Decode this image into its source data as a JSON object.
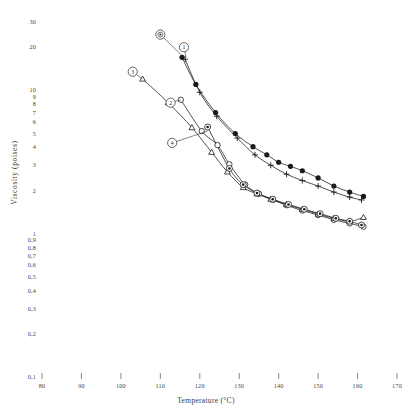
{
  "chart_data": {
    "type": "line",
    "title": "",
    "xlabel": "Temperature (°C)",
    "ylabel": "Viscosity (poises)",
    "xlim": [
      80,
      170
    ],
    "ylim": [
      0.1,
      30
    ],
    "yscale": "log",
    "xscale": "linear",
    "grid": false,
    "legend": "none",
    "xticks": [
      80,
      90,
      100,
      110,
      120,
      130,
      140,
      150,
      160,
      170
    ],
    "xtick_labels": [
      "80",
      "90",
      "100",
      "110",
      "120",
      "130",
      "140",
      "150",
      "160",
      "170"
    ],
    "yticks": [
      30,
      20,
      10,
      9,
      8,
      7,
      6,
      5,
      4,
      3,
      2,
      1,
      0.9,
      0.8,
      0.7,
      0.6,
      0.5,
      0.4,
      0.3,
      0.2,
      0.1
    ],
    "ytick_labels": [
      "30",
      "20",
      "10",
      "9",
      "8",
      "7",
      "6",
      "5",
      "4",
      "3",
      "2",
      "1",
      "0,9",
      "0,8",
      "0,7",
      "0,6",
      "0,5",
      "0,4",
      "0,3",
      "0,2",
      "0,1"
    ],
    "annotations": [
      {
        "text": "⓪",
        "label": "circled-marker",
        "x": 110.0,
        "y": 24.5,
        "anchor_x": 115.5,
        "anchor_y": 17.5
      },
      {
        "text": "①",
        "label": "1",
        "x": 116.0,
        "y": 20.0,
        "anchor_x": 116.5,
        "anchor_y": 17.0
      },
      {
        "text": "②",
        "label": "2",
        "x": 112.6,
        "y": 8.2,
        "anchor_x": 115.2,
        "anchor_y": 8.6
      },
      {
        "text": "③",
        "label": "3",
        "x": 103.0,
        "y": 13.5,
        "anchor_x": 105.5,
        "anchor_y": 12.0
      },
      {
        "text": "④",
        "label": "4",
        "x": 113.0,
        "y": 4.3,
        "anchor_x": 122.0,
        "anchor_y": 5.2
      }
    ],
    "series": [
      {
        "name": "Series 1 (filled circle)",
        "marker": "filled-circle",
        "color": "#1a1a1a",
        "x": [
          115.5,
          119.0,
          124.0,
          129.0,
          133.5,
          137.0,
          140.0,
          143.0,
          146.0,
          150.0,
          154.0,
          158.0,
          161.5
        ],
        "values": [
          17.0,
          11.0,
          7.0,
          5.0,
          4.05,
          3.55,
          3.15,
          2.95,
          2.75,
          2.45,
          2.15,
          1.95,
          1.82
        ]
      },
      {
        "name": "Series 2 (plus)",
        "marker": "plus",
        "color": "#1a1a1a",
        "x": [
          116.3,
          120.0,
          124.3,
          129.5,
          134.0,
          138.0,
          142.0,
          146.0,
          150.0,
          154.0,
          158.0,
          161.0
        ],
        "values": [
          16.5,
          9.7,
          6.6,
          4.65,
          3.55,
          3.0,
          2.6,
          2.35,
          2.15,
          1.95,
          1.8,
          1.72
        ]
      },
      {
        "name": "Series 3 (open circle)",
        "marker": "open-circle",
        "color": "#1a1a1a",
        "x": [
          115.2,
          120.5,
          124.5,
          127.5,
          131.5,
          135.0,
          138.5,
          142.0,
          146.0,
          150.0,
          154.0,
          158.0,
          161.5
        ],
        "values": [
          8.6,
          5.2,
          4.15,
          3.05,
          2.2,
          1.9,
          1.72,
          1.58,
          1.45,
          1.35,
          1.25,
          1.18,
          1.12
        ]
      },
      {
        "name": "Series 4 (triangle)",
        "marker": "triangle",
        "color": "#1a1a1a",
        "x": [
          105.5,
          112.0,
          118.0,
          123.0,
          127.0,
          131.0,
          134.5,
          138.0,
          142.0,
          146.0,
          150.0,
          154.0,
          158.0,
          161.5
        ],
        "values": [
          12.0,
          8.2,
          5.5,
          3.7,
          2.7,
          2.1,
          1.9,
          1.74,
          1.6,
          1.48,
          1.37,
          1.28,
          1.22,
          1.3
        ]
      },
      {
        "name": "Series 5 (circled dot)",
        "marker": "circled-dot",
        "color": "#1a1a1a",
        "x": [
          122.0,
          127.5,
          131.0,
          134.5,
          138.5,
          142.5,
          146.5,
          150.5,
          154.5,
          158.0,
          161.0
        ],
        "values": [
          5.55,
          2.85,
          2.2,
          1.92,
          1.74,
          1.6,
          1.48,
          1.38,
          1.28,
          1.22,
          1.15
        ]
      }
    ]
  }
}
